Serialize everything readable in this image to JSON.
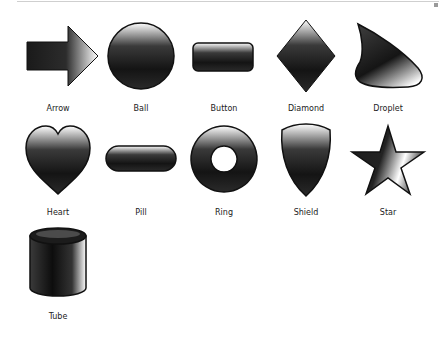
{
  "gallery": {
    "title": "Shape gallery",
    "shapes": [
      {
        "id": "arrow",
        "label": "Arrow"
      },
      {
        "id": "ball",
        "label": "Ball"
      },
      {
        "id": "button",
        "label": "Button"
      },
      {
        "id": "diamond",
        "label": "Diamond"
      },
      {
        "id": "droplet",
        "label": "Droplet"
      },
      {
        "id": "heart",
        "label": "Heart"
      },
      {
        "id": "pill",
        "label": "Pill"
      },
      {
        "id": "ring",
        "label": "Ring"
      },
      {
        "id": "shield",
        "label": "Shield"
      },
      {
        "id": "star",
        "label": "Star"
      },
      {
        "id": "tube",
        "label": "Tube"
      }
    ]
  },
  "colors": {
    "fill_dark": "#1a1a1a",
    "highlight": "#ffffff",
    "label": "#222222"
  }
}
